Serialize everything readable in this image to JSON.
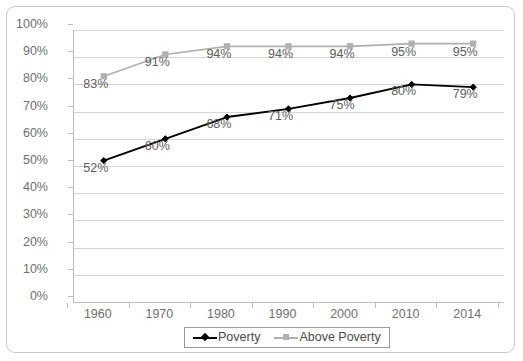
{
  "chart_data": {
    "type": "line",
    "title": "",
    "subtitle": "",
    "xlabel": "",
    "ylabel": "",
    "categories": [
      "1960",
      "1970",
      "1980",
      "1990",
      "2000",
      "2010",
      "2014"
    ],
    "series": [
      {
        "name": "Poverty",
        "color": "#000000",
        "marker": "diamond",
        "values": [
          52,
          60,
          68,
          71,
          75,
          80,
          79
        ],
        "data_labels": [
          "52%",
          "60%",
          "68%",
          "71%",
          "75%",
          "80%",
          "79%"
        ]
      },
      {
        "name": "Above Poverty",
        "color": "#b0b0b0",
        "marker": "square",
        "values": [
          83,
          91,
          94,
          94,
          94,
          95,
          95
        ],
        "data_labels": [
          "83%",
          "91%",
          "94%",
          "94%",
          "94%",
          "95%",
          "95%"
        ]
      }
    ],
    "ylim": [
      0,
      100
    ],
    "ytick_values": [
      0,
      10,
      20,
      30,
      40,
      50,
      60,
      70,
      80,
      90,
      100
    ],
    "ytick_labels": [
      "0%",
      "10%",
      "20%",
      "30%",
      "40%",
      "50%",
      "60%",
      "70%",
      "80%",
      "90%",
      "100%"
    ],
    "grid": "horizontal",
    "legend_position": "bottom-center",
    "annotations": []
  },
  "axes": {
    "y_labels": [
      "100%",
      "90%",
      "80%",
      "70%",
      "60%",
      "50%",
      "40%",
      "30%",
      "20%",
      "10%",
      "0%"
    ],
    "x_labels": [
      "1960",
      "1970",
      "1980",
      "1990",
      "2000",
      "2010",
      "2014"
    ]
  },
  "legend": {
    "items": [
      {
        "label": "Poverty",
        "color": "#000000",
        "marker": "diamond"
      },
      {
        "label": "Above Poverty",
        "color": "#b0b0b0",
        "marker": "square"
      }
    ]
  },
  "colors": {
    "poverty": "#000000",
    "above_poverty": "#b0b0b0",
    "gridline": "#d6d6d6",
    "axis": "#bdbdbd",
    "tick_text": "#6f6f6f",
    "data_label_text": "#5d5d5d",
    "frame_border": "#c9c9c9",
    "background": "#ffffff"
  }
}
